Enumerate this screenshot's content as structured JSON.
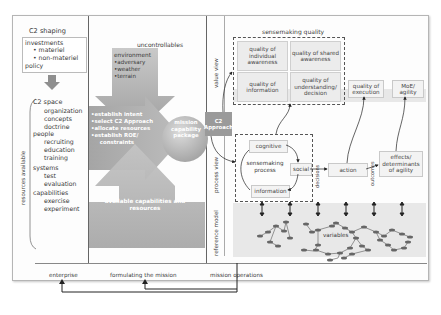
{
  "left_panel": {
    "c2_shaping": {
      "title": "C2 shaping",
      "investments_label": "investments",
      "investments_items": [
        "• materiel",
        "• non-materiel"
      ],
      "policy_label": "policy"
    },
    "resources_label": "resources available",
    "c2_space": {
      "title": "C2 space",
      "items": [
        "organization",
        "concepts",
        "doctrine"
      ]
    },
    "people": {
      "title": "people",
      "items": [
        "recruiting",
        "education",
        "training"
      ]
    },
    "systems": {
      "title": "systems",
      "items": [
        "test",
        "evaluation"
      ]
    },
    "capabilities": {
      "title": "capabilities",
      "items": [
        "exercise",
        "experiment"
      ]
    }
  },
  "middle_panel": {
    "uncontrollables_label": "uncontrollables",
    "environment": {
      "title": "environment",
      "items": [
        "•adversary",
        "•weather",
        "•terrain"
      ]
    },
    "left_arrow_items": [
      "•establish intent",
      "•select C2 Approach",
      "•allocate resources",
      "•establish ROE/",
      "  constraints"
    ],
    "mission_capability_package": "mission capability package",
    "available_capabilities": "available capabilities and resources"
  },
  "right_panel": {
    "view_labels": {
      "value_view": "value view",
      "process_view": "process view",
      "reference_model": "reference model"
    },
    "sensemaking_quality_label": "sensemaking quality",
    "quality_boxes": [
      "quality of individual awareness",
      "quality of shared awareness",
      "quality of information",
      "quality of understanding/ decision"
    ],
    "quality_of_execution": "quality of execution",
    "moe_agility": "MoE/ agility",
    "c2_approach": "C2 Approach",
    "sensemaking_process": {
      "cognitive": "cognitive",
      "process_label": "sensemaking process",
      "social": "social",
      "information": "information"
    },
    "decisions_label": "decisions",
    "action": "action",
    "outcomes_label": "outcomes",
    "effects": "effects/ determinants of agility",
    "variables_label": "variables"
  },
  "bottom_bar": {
    "enterprise": "enterprise",
    "formulating_the_mission": "formulating the mission",
    "mission_operations": "mission operations"
  },
  "colors": {
    "gray_arrow": "#a9a9a9",
    "light_band": "#e8e8e8",
    "box_fill": "#ececec",
    "line": "#333333"
  }
}
